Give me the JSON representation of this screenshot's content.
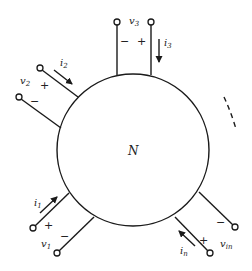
{
  "diagram": {
    "network_label": "N",
    "ports": [
      {
        "id": "port-1",
        "voltage": "v",
        "voltage_sub": "1",
        "current": "i",
        "current_sub": "1",
        "plus": "+",
        "minus": "−"
      },
      {
        "id": "port-2",
        "voltage": "v",
        "voltage_sub": "2",
        "current": "i",
        "current_sub": "2",
        "plus": "+",
        "minus": "−"
      },
      {
        "id": "port-3",
        "voltage": "v",
        "voltage_sub": "3",
        "current": "i",
        "current_sub": "3",
        "plus": "+",
        "minus": "−"
      },
      {
        "id": "port-n",
        "voltage": "v",
        "voltage_sub": "in",
        "current": "i",
        "current_sub": "n",
        "plus": "+",
        "minus": "−"
      }
    ],
    "ellipsis": "dashed arc indicating more ports"
  }
}
